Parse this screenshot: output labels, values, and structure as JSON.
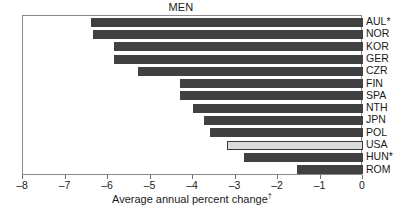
{
  "chart_data": {
    "type": "bar",
    "orientation": "horizontal",
    "title": "MEN",
    "xlabel": "Average annual percent change",
    "xlabel_marker": "†",
    "ylabel": "",
    "xlim": [
      -8,
      0
    ],
    "grid": false,
    "legend": null,
    "xticks": [
      -8,
      -7,
      -6,
      -5,
      -4,
      -3,
      -2,
      -1,
      0
    ],
    "xtick_labels": [
      "–8",
      "–7",
      "–6",
      "–5",
      "–4",
      "–3",
      "–2",
      "–1",
      "0"
    ],
    "categories": [
      "AUL*",
      "NOR",
      "KOR",
      "GER",
      "CZR",
      "FIN",
      "SPA",
      "NTH",
      "JPN",
      "POL",
      "USA",
      "HUN*",
      "ROM"
    ],
    "values": [
      -6.4,
      -6.35,
      -5.85,
      -5.85,
      -5.3,
      -4.3,
      -4.3,
      -4.0,
      -3.75,
      -3.6,
      -3.2,
      -2.8,
      -1.55
    ],
    "highlight_category": "USA",
    "colors": {
      "bar": "#414141",
      "bar_highlight": "#dcdcdc",
      "bar_highlight_border": "#3a3a3a",
      "axis": "#8a8a8a",
      "text": "#1a1a1a",
      "background": "#ffffff"
    }
  }
}
